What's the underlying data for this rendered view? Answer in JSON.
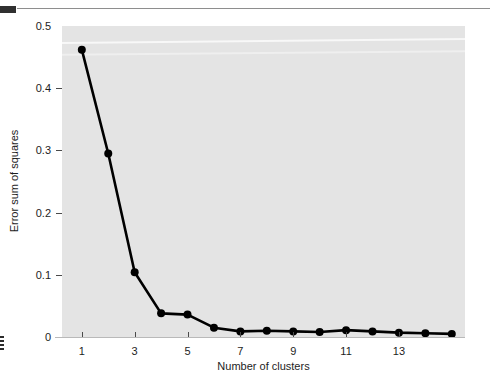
{
  "figure": {
    "background_color": "#ffffff",
    "plot_background_color": "#e4e4e4",
    "series_color": "#000000"
  },
  "artifacts": {
    "top_rule": "scan-rule",
    "top_block": "scan-block",
    "left_mark": "scan-edge-mark"
  },
  "chart_data": {
    "type": "line",
    "title": "",
    "xlabel": "Number of clusters",
    "ylabel": "Error sum of squares",
    "x": [
      1,
      2,
      3,
      4,
      5,
      6,
      7,
      8,
      9,
      10,
      11,
      12,
      13,
      14,
      15
    ],
    "values": [
      0.462,
      0.295,
      0.104,
      0.038,
      0.036,
      0.015,
      0.009,
      0.01,
      0.009,
      0.008,
      0.011,
      0.009,
      0.007,
      0.006,
      0.005
    ],
    "series": [
      {
        "name": "Error sum of squares",
        "values": [
          0.462,
          0.295,
          0.104,
          0.038,
          0.036,
          0.015,
          0.009,
          0.01,
          0.009,
          0.008,
          0.011,
          0.009,
          0.007,
          0.006,
          0.005
        ]
      }
    ],
    "xlim": [
      0.25,
      15.5
    ],
    "ylim": [
      0,
      0.5
    ],
    "xticks": [
      1,
      3,
      5,
      7,
      9,
      11,
      13
    ],
    "xtick_labels": [
      "1",
      "3",
      "5",
      "7",
      "9",
      "11",
      "13"
    ],
    "yticks": [
      0,
      0.1,
      0.2,
      0.3,
      0.4,
      0.5
    ],
    "ytick_labels": [
      "0",
      "0.1",
      "0.2",
      "0.3",
      "0.4",
      "0.5"
    ],
    "grid": false,
    "legend": "none",
    "marker": "filled-circle",
    "marker_size": 4,
    "line_width": 2.6
  }
}
